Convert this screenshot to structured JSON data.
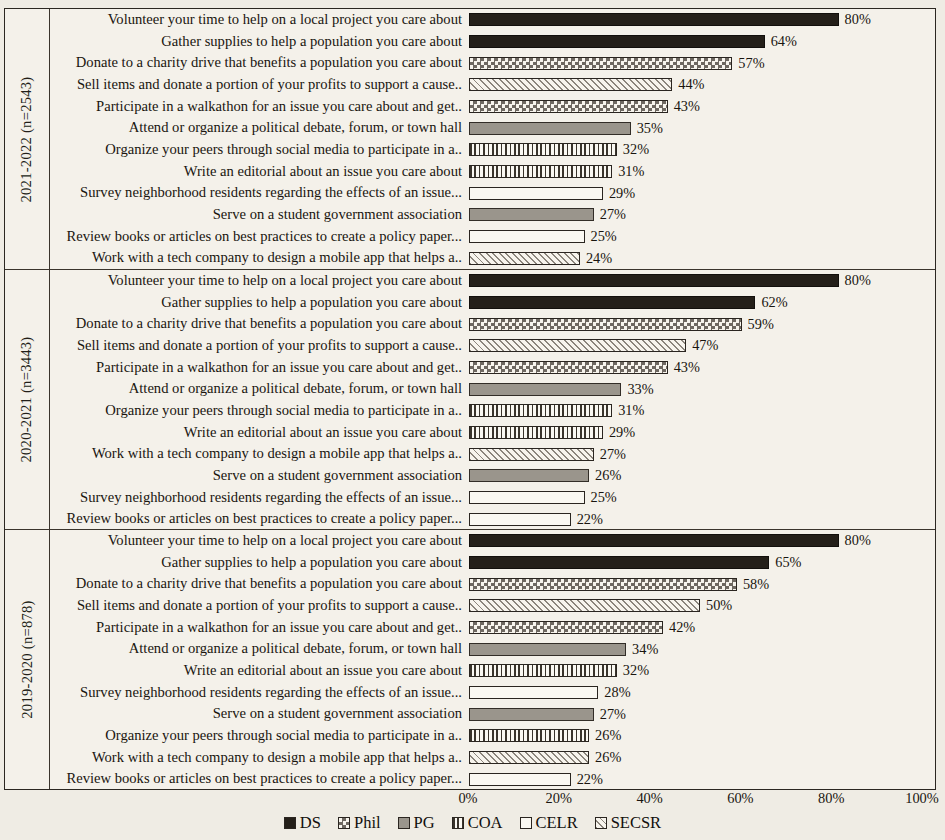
{
  "figure": {
    "type": "grouped-horizontal-bar",
    "x_axis": {
      "ticks": [
        "0%",
        "20%",
        "40%",
        "60%",
        "80%",
        "100%"
      ],
      "min": 0,
      "max": 100
    }
  },
  "legend": {
    "items": [
      {
        "label": "DS",
        "key": "DS",
        "pattern": "solid-dark",
        "color": "#241f19"
      },
      {
        "label": "Phil",
        "key": "Phil",
        "pattern": "checkerboard",
        "color": "#6e6861"
      },
      {
        "label": "PG",
        "key": "PG",
        "pattern": "solid-gray",
        "color": "#9a958c"
      },
      {
        "label": "COA",
        "key": "COA",
        "pattern": "vertical-lines",
        "color": "#3a342c"
      },
      {
        "label": "CELR",
        "key": "CELR",
        "pattern": "empty-white",
        "color": "#faf8f2"
      },
      {
        "label": "SECSR",
        "key": "SECSR",
        "pattern": "diagonal-hatch",
        "color": "#8b857c"
      }
    ]
  },
  "chart_data": {
    "type": "bar",
    "title": "",
    "xlabel": "",
    "ylabel": "",
    "xlim": [
      0,
      100
    ],
    "xticks": [
      "0%",
      "20%",
      "40%",
      "60%",
      "80%",
      "100%"
    ],
    "grid": true,
    "legend_position": "bottom",
    "orientation": "horizontal",
    "groups": [
      {
        "label": "2021-2022 (n=2543)",
        "n": 2543,
        "rows": [
          {
            "category": "Volunteer your time to help on a local project you care about",
            "value": 80,
            "value_label": "80%",
            "series": "DS"
          },
          {
            "category": "Gather supplies to help a population you care about",
            "value": 64,
            "value_label": "64%",
            "series": "DS"
          },
          {
            "category": "Donate to a charity drive that benefits a population you care about",
            "value": 57,
            "value_label": "57%",
            "series": "Phil"
          },
          {
            "category": "Sell items and donate a portion of your profits to support a cause..",
            "value": 44,
            "value_label": "44%",
            "series": "SECSR"
          },
          {
            "category": "Participate in a walkathon for an issue you care about and get..",
            "value": 43,
            "value_label": "43%",
            "series": "Phil"
          },
          {
            "category": "Attend or organize a political debate, forum, or town hall",
            "value": 35,
            "value_label": "35%",
            "series": "PG"
          },
          {
            "category": "Organize your peers through social media to participate in a..",
            "value": 32,
            "value_label": "32%",
            "series": "COA"
          },
          {
            "category": "Write an editorial about an issue you care about",
            "value": 31,
            "value_label": "31%",
            "series": "COA"
          },
          {
            "category": "Survey neighborhood residents regarding the effects of an issue...",
            "value": 29,
            "value_label": "29%",
            "series": "CELR"
          },
          {
            "category": "Serve on a student government association",
            "value": 27,
            "value_label": "27%",
            "series": "PG"
          },
          {
            "category": "Review books or articles on best practices to create a policy paper...",
            "value": 25,
            "value_label": "25%",
            "series": "CELR"
          },
          {
            "category": "Work with a tech company to design a mobile app that helps a..",
            "value": 24,
            "value_label": "24%",
            "series": "SECSR"
          }
        ]
      },
      {
        "label": "2020-2021 (n=3443)",
        "n": 3443,
        "rows": [
          {
            "category": "Volunteer your time to help on a local project you care about",
            "value": 80,
            "value_label": "80%",
            "series": "DS"
          },
          {
            "category": "Gather supplies to help a population you care about",
            "value": 62,
            "value_label": "62%",
            "series": "DS"
          },
          {
            "category": "Donate to a charity drive that benefits a population you care about",
            "value": 59,
            "value_label": "59%",
            "series": "Phil"
          },
          {
            "category": "Sell items and donate a portion of your profits to support a cause..",
            "value": 47,
            "value_label": "47%",
            "series": "SECSR"
          },
          {
            "category": "Participate in a walkathon for an issue you care about and get..",
            "value": 43,
            "value_label": "43%",
            "series": "Phil"
          },
          {
            "category": "Attend or organize a political debate, forum, or town hall",
            "value": 33,
            "value_label": "33%",
            "series": "PG"
          },
          {
            "category": "Organize your peers through social media to participate in a..",
            "value": 31,
            "value_label": "31%",
            "series": "COA"
          },
          {
            "category": "Write an editorial about an issue you care about",
            "value": 29,
            "value_label": "29%",
            "series": "COA"
          },
          {
            "category": "Work with a tech company to design a mobile app that helps a..",
            "value": 27,
            "value_label": "27%",
            "series": "SECSR"
          },
          {
            "category": "Serve on a student government association",
            "value": 26,
            "value_label": "26%",
            "series": "PG"
          },
          {
            "category": "Survey neighborhood residents regarding the effects of an issue...",
            "value": 25,
            "value_label": "25%",
            "series": "CELR"
          },
          {
            "category": "Review books or articles on best practices to create a policy paper...",
            "value": 22,
            "value_label": "22%",
            "series": "CELR"
          }
        ]
      },
      {
        "label": "2019-2020 (n=878)",
        "n": 878,
        "rows": [
          {
            "category": "Volunteer your time to help on a local project you care about",
            "value": 80,
            "value_label": "80%",
            "series": "DS"
          },
          {
            "category": "Gather supplies to help a population you care about",
            "value": 65,
            "value_label": "65%",
            "series": "DS"
          },
          {
            "category": "Donate to a charity drive that benefits a population you care about",
            "value": 58,
            "value_label": "58%",
            "series": "Phil"
          },
          {
            "category": "Sell items and donate a portion of your profits to support a cause..",
            "value": 50,
            "value_label": "50%",
            "series": "SECSR"
          },
          {
            "category": "Participate in a walkathon for an issue you care about and get..",
            "value": 42,
            "value_label": "42%",
            "series": "Phil"
          },
          {
            "category": "Attend or organize a political debate, forum, or town hall",
            "value": 34,
            "value_label": "34%",
            "series": "PG"
          },
          {
            "category": "Write an editorial about an issue you care about",
            "value": 32,
            "value_label": "32%",
            "series": "COA"
          },
          {
            "category": "Survey neighborhood residents regarding the effects of an issue...",
            "value": 28,
            "value_label": "28%",
            "series": "CELR"
          },
          {
            "category": "Serve on a student government association",
            "value": 27,
            "value_label": "27%",
            "series": "PG"
          },
          {
            "category": "Organize your peers through social media to participate in a..",
            "value": 26,
            "value_label": "26%",
            "series": "COA"
          },
          {
            "category": "Work with a tech company to design a mobile app that helps a..",
            "value": 26,
            "value_label": "26%",
            "series": "SECSR"
          },
          {
            "category": "Review books or articles on best practices to create a policy paper...",
            "value": 22,
            "value_label": "22%",
            "series": "CELR"
          }
        ]
      }
    ]
  }
}
